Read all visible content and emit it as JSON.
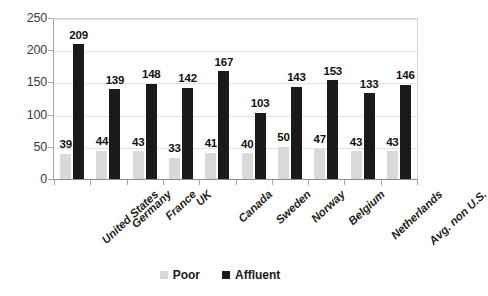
{
  "chart_data": {
    "type": "bar",
    "title": "",
    "subtitle": "",
    "xlabel": "",
    "ylabel": "",
    "ylim": [
      0,
      250
    ],
    "yticks": [
      "0",
      "50",
      "100",
      "150",
      "200",
      "250"
    ],
    "grid": true,
    "legend_position": "bottom",
    "categories": [
      "United States",
      "Germany",
      "France",
      "UK",
      "Canada",
      "Sweden",
      "Norway",
      "Belgium",
      "Netherlands",
      "Avg. non U.S."
    ],
    "series": [
      {
        "name": "Poor",
        "color": "#d9d9d9",
        "values": [
          39,
          44,
          43,
          33,
          41,
          40,
          50,
          47,
          43,
          43
        ]
      },
      {
        "name": "Affluent",
        "color": "#1a1a1a",
        "values": [
          209,
          139,
          148,
          142,
          167,
          103,
          143,
          153,
          133,
          146
        ]
      }
    ]
  },
  "legend": {
    "items": [
      {
        "label": "Poor",
        "color": "#d9d9d9"
      },
      {
        "label": "Affluent",
        "color": "#1a1a1a"
      }
    ]
  },
  "colors": {
    "poor": "#d9d9d9",
    "affluent": "#1a1a1a",
    "axis": "#a6a6a6",
    "grid": "#e2e2e2",
    "text": "#1a1a1a",
    "background": "#ffffff"
  }
}
